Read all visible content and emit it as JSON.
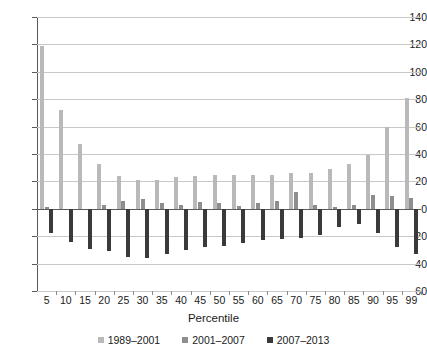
{
  "chart_data": {
    "type": "bar",
    "title": "",
    "xlabel": "Percentile",
    "ylabel": "",
    "ylim": [
      -60,
      140
    ],
    "ytick_step": 20,
    "yticks": [
      140,
      120,
      100,
      80,
      60,
      40,
      20,
      0,
      -20,
      -40,
      -60
    ],
    "ytick_labels": [
      "140",
      "120",
      "100",
      "80",
      "60",
      "40",
      "20",
      "0",
      "−20",
      "−40",
      "−60"
    ],
    "grid": true,
    "legend_position": "bottom",
    "categories": [
      "5",
      "10",
      "15",
      "20",
      "25",
      "30",
      "35",
      "40",
      "45",
      "50",
      "55",
      "60",
      "65",
      "70",
      "75",
      "80",
      "85",
      "90",
      "95",
      "99"
    ],
    "series": [
      {
        "name": "1989–2001",
        "color": "#b9b9b9",
        "values": [
          119,
          72,
          47,
          33,
          24,
          21,
          21,
          23,
          24,
          25,
          25,
          25,
          25,
          26,
          26,
          29,
          33,
          39,
          60,
          81
        ]
      },
      {
        "name": "2001–2007",
        "color": "#8e8e8e",
        "values": [
          1,
          0,
          0,
          3,
          6,
          7,
          4,
          3,
          5,
          4,
          2,
          4,
          6,
          12,
          3,
          1,
          3,
          10,
          9,
          8
        ]
      },
      {
        "name": "2007–2013",
        "color": "#3a3a3a",
        "values": [
          -18,
          -24,
          -29,
          -31,
          -35,
          -36,
          -33,
          -30,
          -28,
          -27,
          -25,
          -23,
          -22,
          -21,
          -19,
          -13,
          -11,
          -18,
          -28,
          -33
        ]
      }
    ]
  },
  "axis": {
    "x_label": "Percentile"
  },
  "legend": {
    "items": [
      {
        "label": "1989–2001",
        "color": "#b9b9b9"
      },
      {
        "label": "2001–2007",
        "color": "#8e8e8e"
      },
      {
        "label": "2007–2013",
        "color": "#3a3a3a"
      }
    ]
  }
}
